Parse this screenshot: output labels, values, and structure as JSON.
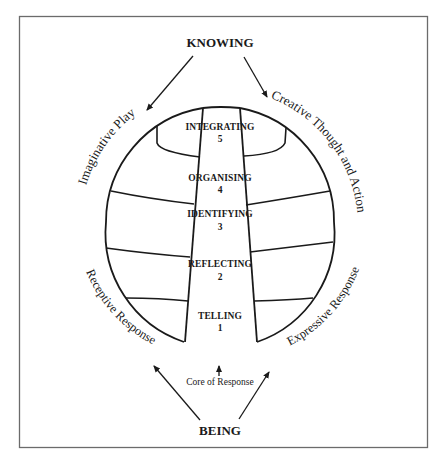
{
  "diagram": {
    "top_label": "KNOWING",
    "bottom_label": "BEING",
    "core_label": "Core of Response",
    "arc_labels": {
      "upper_left": "Imaginative Play",
      "upper_right": "Creative Thought and Action",
      "lower_left": "Receptive Response",
      "lower_right": "Expressive Response"
    },
    "stages": [
      {
        "name": "INTEGRATING",
        "number": "5"
      },
      {
        "name": "ORGANISING",
        "number": "4"
      },
      {
        "name": "IDENTIFYING",
        "number": "3"
      },
      {
        "name": "REFLECTING",
        "number": "2"
      },
      {
        "name": "TELLING",
        "number": "1"
      }
    ],
    "colors": {
      "line": "#1a1a1a",
      "frame": "#6b6b6b",
      "background": "#ffffff"
    }
  }
}
